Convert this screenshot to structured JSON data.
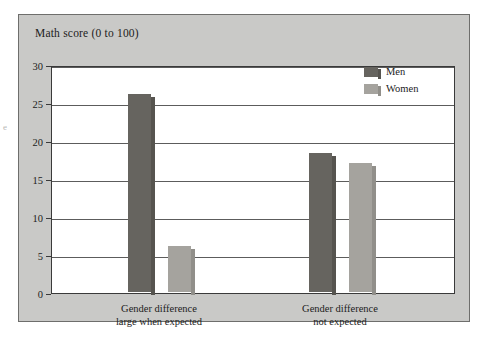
{
  "chart_data": {
    "type": "bar",
    "title": "",
    "ylabel": "Math score (0 to 100)",
    "xlabel": "",
    "categories": [
      "Gender difference large when expected",
      "Gender difference not expected"
    ],
    "category_lines": [
      [
        "Gender difference",
        "large when expected"
      ],
      [
        "Gender difference",
        "not expected"
      ]
    ],
    "series": [
      {
        "name": "Men",
        "values": [
          26.0,
          18.3
        ],
        "color": "#66645f"
      },
      {
        "name": "Women",
        "values": [
          6.0,
          17.0
        ],
        "color": "#a5a39e"
      }
    ],
    "ylim": [
      0,
      30
    ],
    "yticks": [
      0,
      5,
      10,
      15,
      20,
      25,
      30
    ],
    "ytick_labels": [
      "0",
      "5",
      "10",
      "15",
      "20",
      "25",
      "30"
    ],
    "grid": true,
    "grid_axis": "y",
    "legend_position": "top-right",
    "plot_background": "#ffffff",
    "panel_background": "#c9c9c7"
  },
  "axis": {
    "y_title": "Math score (0 to 100)"
  },
  "legend": {
    "entries": [
      {
        "label": "Men"
      },
      {
        "label": "Women"
      }
    ]
  },
  "margin": {
    "mark": "e"
  }
}
